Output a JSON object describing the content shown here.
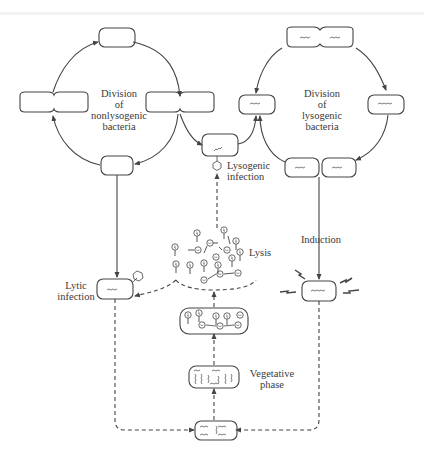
{
  "figure": {
    "stroke_color": "#444444",
    "text_color": "#3a3a3a"
  },
  "labels": {
    "nonlysogenic_cycle": "Division\nof\nnonlysogenic\nbacteria",
    "lysogenic_cycle": "Division\nof\nlysogenic\nbacteria",
    "lysogenic_infection": "Lysogenic\ninfection",
    "lysis": "Lysis",
    "induction": "Induction",
    "lytic_infection": "Lytic\ninfection",
    "vegetative_phase": "Vegetative\nphase"
  },
  "nodes": [
    {
      "id": "nonlyso-top",
      "type": "bacterium"
    },
    {
      "id": "nonlyso-left",
      "type": "dividing-bacterium"
    },
    {
      "id": "nonlyso-right",
      "type": "dividing-bacterium"
    },
    {
      "id": "nonlyso-bottom",
      "type": "bacterium"
    },
    {
      "id": "lyso-top",
      "type": "dividing-bacterium-with-prophage"
    },
    {
      "id": "lyso-left",
      "type": "bacterium-with-prophage"
    },
    {
      "id": "lyso-right",
      "type": "bacterium-with-prophage"
    },
    {
      "id": "lyso-bottom-left",
      "type": "bacterium-with-prophage"
    },
    {
      "id": "lyso-bottom-right",
      "type": "bacterium-with-prophage"
    },
    {
      "id": "lysogenic-infection-cell",
      "type": "bacterium-with-injected-dna"
    },
    {
      "id": "lytic-infection-cell",
      "type": "infected-bacterium"
    },
    {
      "id": "induced-cell",
      "type": "bacterium-with-prophage-irradiated"
    },
    {
      "id": "vegetative-cell",
      "type": "bacterium-replicating-dna"
    },
    {
      "id": "assembly-cell",
      "type": "bacterium-with-phages"
    },
    {
      "id": "early-cell",
      "type": "bacterium-with-phage-dna"
    },
    {
      "id": "released-phages",
      "type": "phage-cloud"
    }
  ],
  "edges": [
    {
      "from": "nonlyso-top",
      "to": "nonlyso-right",
      "style": "solid"
    },
    {
      "from": "nonlyso-right",
      "to": "nonlyso-bottom",
      "style": "solid"
    },
    {
      "from": "nonlyso-bottom",
      "to": "nonlyso-left",
      "style": "solid"
    },
    {
      "from": "nonlyso-left",
      "to": "nonlyso-top",
      "style": "solid"
    },
    {
      "from": "nonlyso-right",
      "to": "lysogenic-infection-cell",
      "style": "solid"
    },
    {
      "from": "lysogenic-infection-cell",
      "to": "lyso-left",
      "style": "solid"
    },
    {
      "from": "lyso-left",
      "to": "lyso-top",
      "style": "solid"
    },
    {
      "from": "lyso-top",
      "to": "lyso-right",
      "style": "solid"
    },
    {
      "from": "lyso-right",
      "to": "lyso-bottom-right",
      "style": "solid"
    },
    {
      "from": "lyso-bottom-left",
      "to": "lyso-left",
      "style": "solid"
    },
    {
      "from": "nonlyso-bottom",
      "to": "lytic-infection-cell",
      "style": "solid"
    },
    {
      "from": "lyso-bottom-right",
      "to": "induced-cell",
      "style": "solid"
    },
    {
      "from": "released-phages",
      "to": "lytic-infection-cell",
      "style": "dashed"
    },
    {
      "from": "released-phages",
      "to": "lysogenic-infection-cell",
      "style": "dashed"
    },
    {
      "from": "lytic-infection-cell",
      "to": "early-cell",
      "style": "dashed"
    },
    {
      "from": "induced-cell",
      "to": "early-cell",
      "style": "dashed"
    },
    {
      "from": "early-cell",
      "to": "vegetative-cell",
      "style": "dashed"
    },
    {
      "from": "vegetative-cell",
      "to": "assembly-cell",
      "style": "dashed"
    },
    {
      "from": "assembly-cell",
      "to": "released-phages",
      "style": "dashed"
    }
  ]
}
